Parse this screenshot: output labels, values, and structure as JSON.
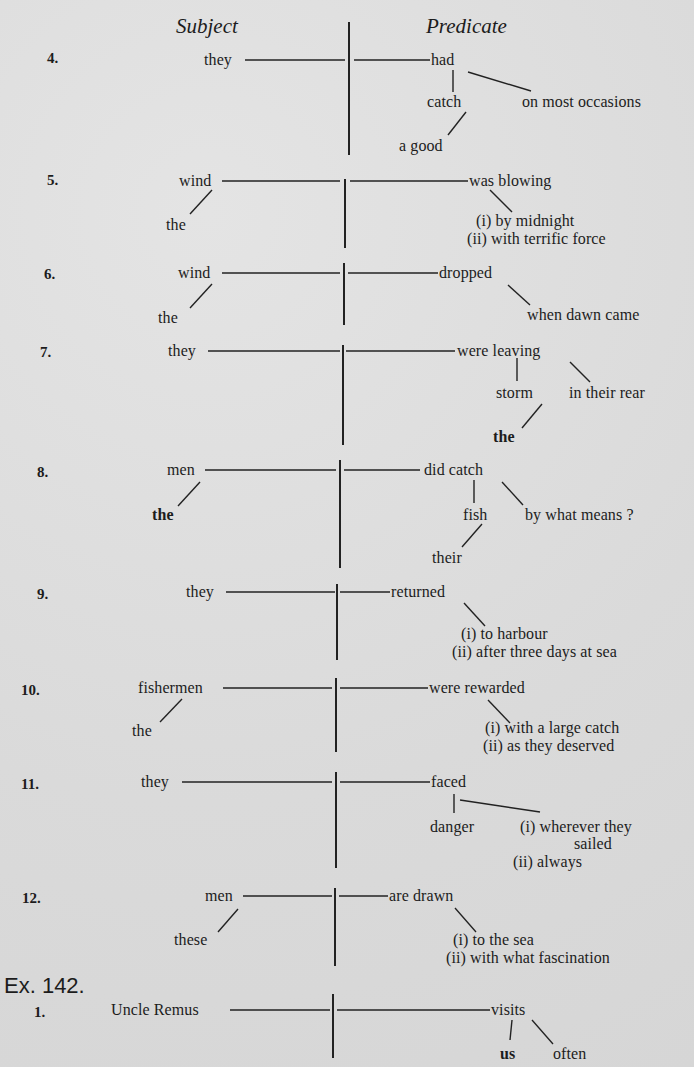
{
  "headers": {
    "subject": "Subject",
    "predicate": "Predicate"
  },
  "exercise_label": "Ex. 142.",
  "diagrams": [
    {
      "number": "4.",
      "subject": "they",
      "predicate": "had",
      "subject_modifiers": [],
      "predicate_children": [
        "catch",
        "on most occasions"
      ],
      "sub_children": [
        "a good"
      ]
    },
    {
      "number": "5.",
      "subject": "wind",
      "predicate": "was blowing",
      "subject_modifiers": [
        "the"
      ],
      "predicate_children": [
        "(i) by midnight",
        "(ii) with terrific force"
      ]
    },
    {
      "number": "6.",
      "subject": "wind",
      "predicate": "dropped",
      "subject_modifiers": [
        "the"
      ],
      "predicate_children": [
        "when dawn came"
      ]
    },
    {
      "number": "7.",
      "subject": "they",
      "predicate": "were leaving",
      "subject_modifiers": [],
      "predicate_children": [
        "storm",
        "in their rear"
      ],
      "sub_children": [
        "the"
      ]
    },
    {
      "number": "8.",
      "subject": "men",
      "predicate": "did catch",
      "subject_modifiers": [
        "the"
      ],
      "predicate_children": [
        "fish",
        "by what means ?"
      ],
      "sub_children": [
        "their"
      ]
    },
    {
      "number": "9.",
      "subject": "they",
      "predicate": "returned",
      "subject_modifiers": [],
      "predicate_children": [
        "(i) to harbour",
        "(ii) after three days at sea"
      ]
    },
    {
      "number": "10.",
      "subject": "fishermen",
      "predicate": "were rewarded",
      "subject_modifiers": [
        "the"
      ],
      "predicate_children": [
        "(i) with a large catch",
        "(ii) as they deserved"
      ]
    },
    {
      "number": "11.",
      "subject": "they",
      "predicate": "faced",
      "subject_modifiers": [],
      "predicate_children": [
        "danger",
        "(i) wherever they",
        "sailed",
        "(ii) always"
      ]
    },
    {
      "number": "12.",
      "subject": "men",
      "predicate": "are drawn",
      "subject_modifiers": [
        "these"
      ],
      "predicate_children": [
        "(i) to the sea",
        "(ii) with what fascination"
      ]
    },
    {
      "number": "1.",
      "subject": "Uncle Remus",
      "predicate": "visits",
      "subject_modifiers": [],
      "predicate_children": [
        "us",
        "often"
      ]
    }
  ]
}
